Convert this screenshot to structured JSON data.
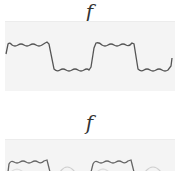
{
  "figure": {
    "top_panel": {
      "label": "f",
      "description": "Square wave approximation with Gibbs ringing (partial Fourier sum)",
      "line_color": "#555555",
      "background_color": "#f4f4f4"
    },
    "bottom_panel": {
      "label": "f",
      "description": "Square wave approximation, cropped at bottom edge",
      "line_color": "#666666",
      "ghost_color": "#cfcfcf",
      "background_color": "#f4f4f4"
    }
  }
}
